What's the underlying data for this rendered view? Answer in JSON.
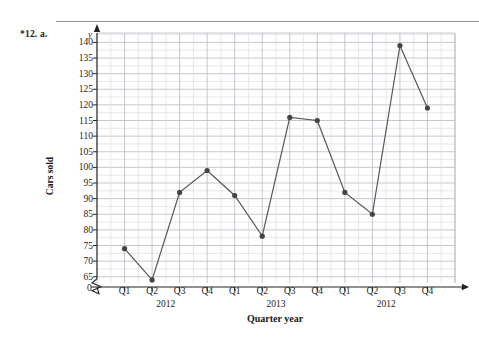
{
  "exercise": {
    "label": "*12. a."
  },
  "axis_letters": {
    "y": "y",
    "x": "x",
    "origin": "0"
  },
  "chart_data": {
    "type": "line",
    "title": "",
    "xlabel": "Quarter year",
    "ylabel": "Cars sold",
    "categories": [
      "Q1",
      "Q2",
      "Q3",
      "Q4",
      "Q1",
      "Q2",
      "Q3",
      "Q4",
      "Q1",
      "Q2",
      "Q3",
      "Q4"
    ],
    "group_labels": [
      {
        "text": "2012",
        "center_category_index": 1.5
      },
      {
        "text": "2013",
        "center_category_index": 5.5
      },
      {
        "text": "2012",
        "center_category_index": 9.5
      }
    ],
    "values": [
      74,
      64,
      92,
      99,
      91,
      78,
      116,
      115,
      92,
      85,
      139,
      119
    ],
    "yticks": [
      65,
      70,
      75,
      80,
      85,
      90,
      95,
      100,
      105,
      110,
      115,
      120,
      125,
      130,
      135,
      140
    ],
    "ylim": [
      63,
      143
    ],
    "ylim_label_min": 65,
    "ylim_label_max": 140,
    "axis_break": true,
    "grid": true,
    "legend": "none",
    "marker": "circle",
    "line_color": "#555555",
    "marker_color": "#444444",
    "grid_major_color": "#b9b9c4",
    "grid_minor_color": "#dcdce4",
    "axis_color": "#222222"
  }
}
